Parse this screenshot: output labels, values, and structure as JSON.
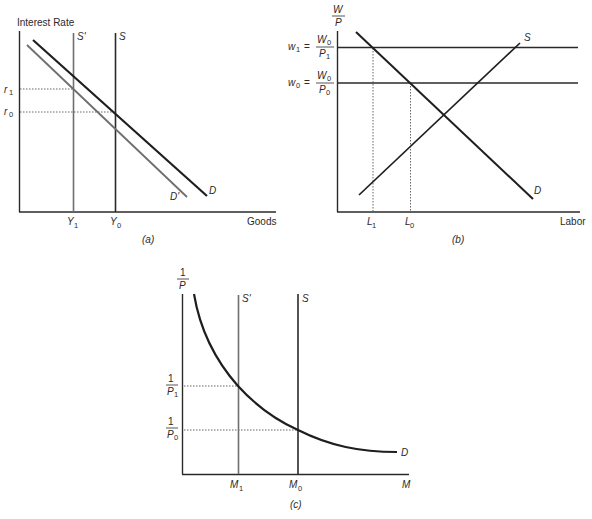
{
  "panels": {
    "a": {
      "caption": "(a)",
      "y_axis_label": "Interest Rate",
      "x_axis_label": "Goods",
      "curves": {
        "S_prime": "S'",
        "S": "S",
        "D": "D",
        "D_prime": "D'"
      },
      "y_ticks": {
        "r1": "r",
        "r1_sub": "1",
        "r0": "r",
        "r0_sub": "0"
      },
      "x_ticks": {
        "Y1": "Y",
        "Y1_sub": "1",
        "Y0": "Y",
        "Y0_sub": "0"
      }
    },
    "b": {
      "caption": "(b)",
      "y_axis_label_num": "W",
      "y_axis_label_den": "P",
      "x_axis_label": "Labor",
      "curves": {
        "S": "S",
        "D": "D"
      },
      "y_ticks": {
        "w1_lhs": "w",
        "w1_lhs_sub": "1",
        "w1_eq": "=",
        "w1_num": "W",
        "w1_num_sub": "0",
        "w1_den": "P",
        "w1_den_sub": "1",
        "w0_lhs": "w",
        "w0_lhs_sub": "0",
        "w0_eq": "=",
        "w0_num": "W",
        "w0_num_sub": "0",
        "w0_den": "P",
        "w0_den_sub": "0"
      },
      "x_ticks": {
        "L1": "L",
        "L1_sub": "1",
        "L0": "L",
        "L0_sub": "0"
      }
    },
    "c": {
      "caption": "(c)",
      "y_axis_label_num": "1",
      "y_axis_label_den": "P",
      "x_axis_label": "M",
      "curves": {
        "S_prime": "S'",
        "S": "S",
        "D": "D"
      },
      "y_ticks": {
        "p1_num": "1",
        "p1_den": "P",
        "p1_sub": "1",
        "p0_num": "1",
        "p0_den": "P",
        "p0_sub": "0"
      },
      "x_ticks": {
        "M1": "M",
        "M1_sub": "1",
        "M0": "M",
        "M0_sub": "0"
      }
    }
  },
  "colors": {
    "axis": "#2a2a2a",
    "primary_curve": "#1e1e1e",
    "shifted_curve": "#6e6e6e",
    "guide_dotted": "#555555"
  }
}
